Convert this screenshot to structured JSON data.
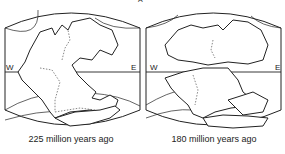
{
  "figure": {
    "top_fragment": "A",
    "panels": [
      {
        "id": "left",
        "caption": "225 million years ago",
        "west_label": "W",
        "east_label": "E"
      },
      {
        "id": "right",
        "caption": "180 million years ago",
        "west_label": "W",
        "east_label": "E"
      }
    ]
  },
  "colors": {
    "line": "#222222",
    "background": "#ffffff"
  }
}
